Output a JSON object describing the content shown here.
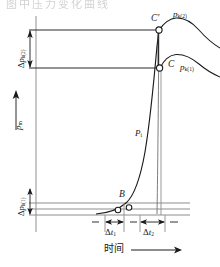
{
  "figure": {
    "caption_partial": "图中压力变化曲线",
    "axes": {
      "y_label": "p",
      "y_label_sub": "m",
      "x_label": "时间",
      "x_arrow": "→",
      "y_arrow": "↑"
    },
    "points": [
      {
        "id": "B",
        "label": "B",
        "x": 120,
        "y": 205
      },
      {
        "id": "C",
        "label": "C",
        "x": 159,
        "y": 68
      },
      {
        "id": "Cp",
        "label": "C′",
        "x": 159,
        "y": 30
      }
    ],
    "curves": [
      {
        "id": "pi",
        "label": "P",
        "label_sub": "i"
      },
      {
        "id": "pk1",
        "label": "p",
        "label_sub": "k(1)"
      },
      {
        "id": "pk2",
        "label": "p",
        "label_sub": "k(2)"
      }
    ],
    "pressure_deltas": [
      {
        "id": "dpk2",
        "delta": "Δ",
        "base": "p",
        "sub": "k(2)"
      },
      {
        "id": "dpk1",
        "delta": "Δ",
        "base": "p",
        "sub": "k(1)"
      }
    ],
    "time_deltas": [
      {
        "id": "dt1",
        "delta": "Δ",
        "base": "t",
        "sub": "1"
      },
      {
        "id": "dt2",
        "delta": "Δ",
        "base": "t",
        "sub": "2"
      }
    ],
    "colors": {
      "ink": "#1a1a1a",
      "line": "#2b2b2b",
      "grid": "#8d8d8d",
      "background": "#ffffff"
    }
  }
}
